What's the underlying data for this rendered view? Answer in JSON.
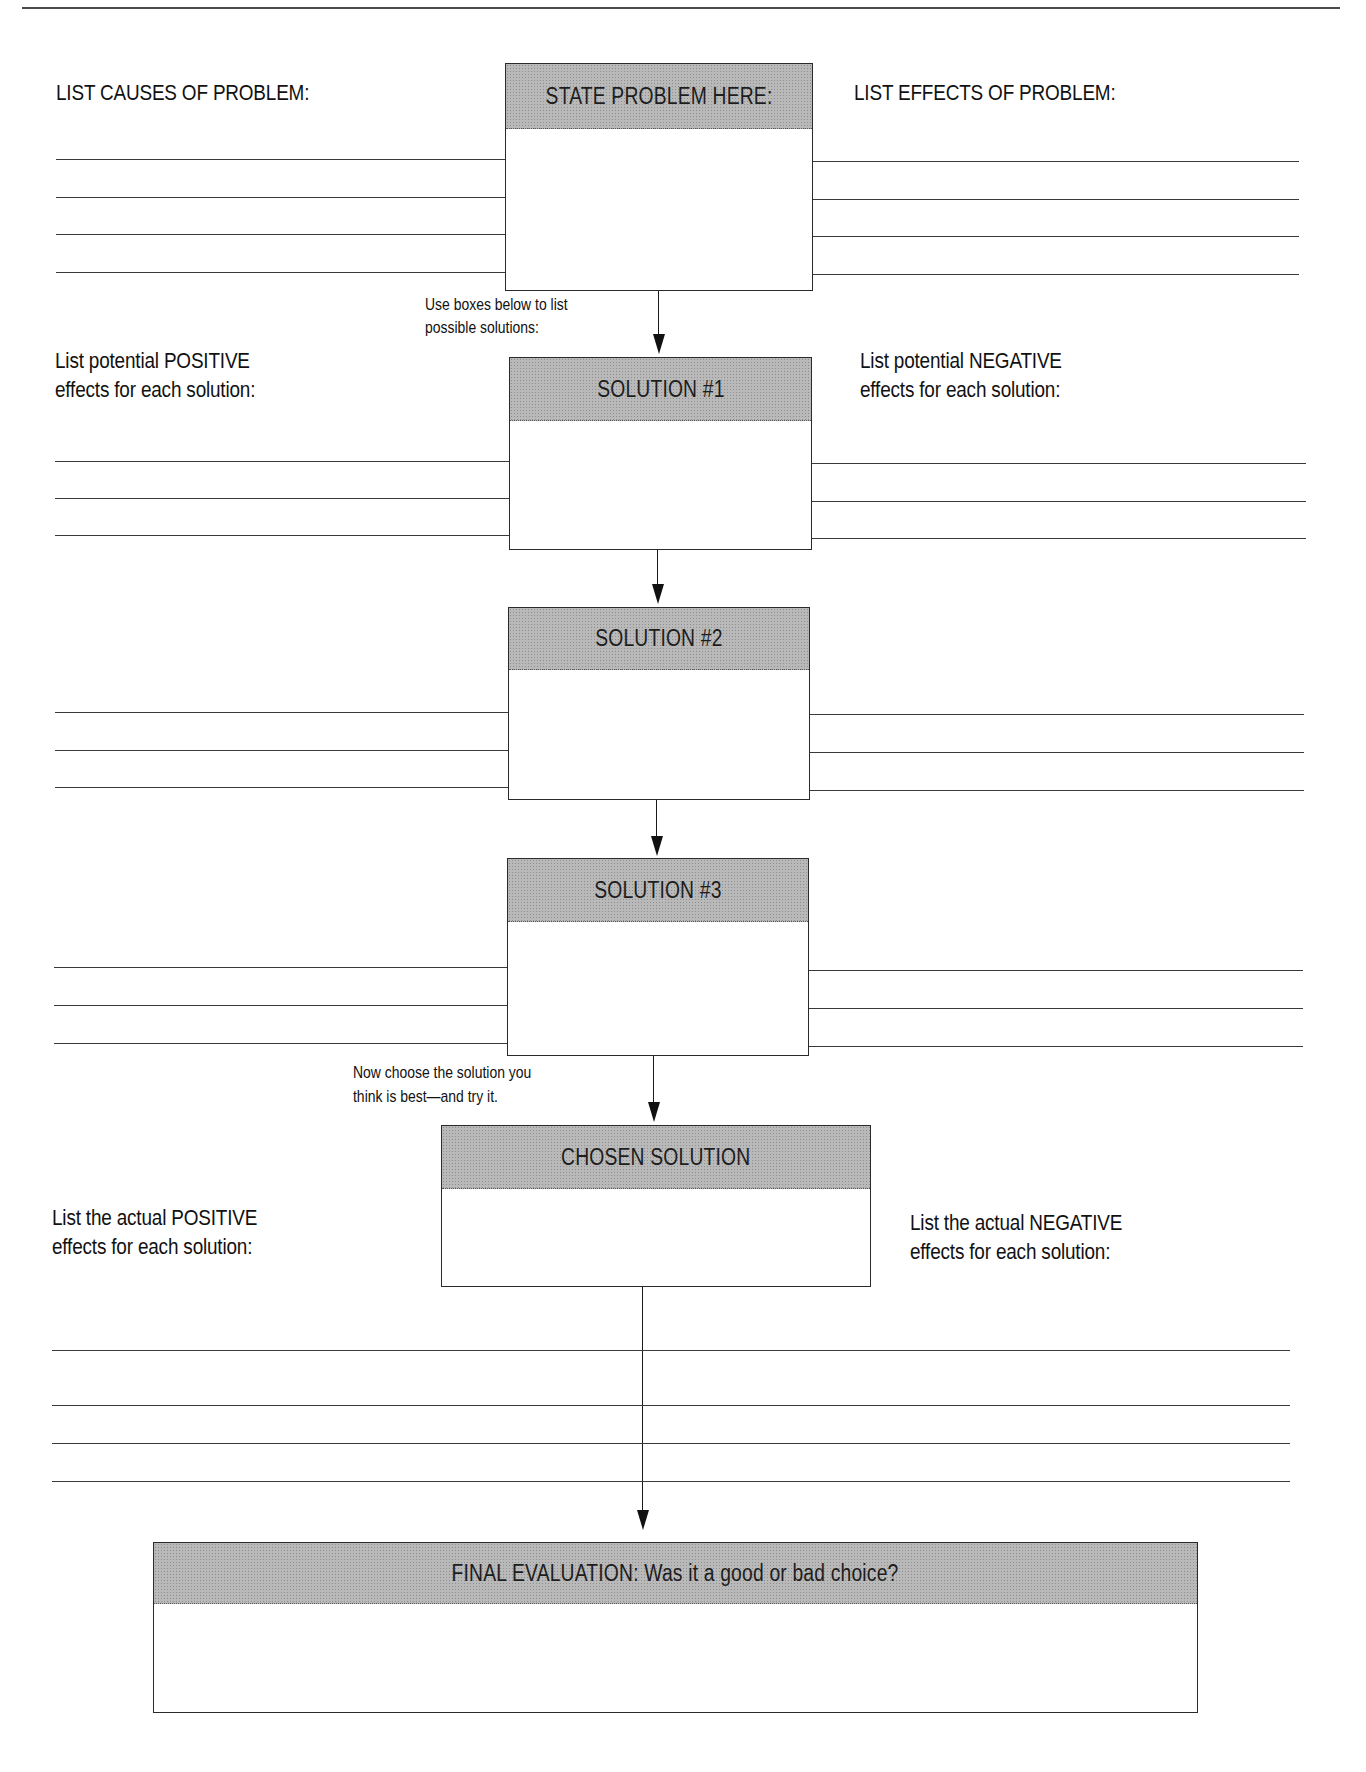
{
  "worksheet": {
    "top_rule_fragment": "g",
    "problem": {
      "causes_label": "LIST CAUSES OF PROBLEM:",
      "box_header": "STATE PROBLEM HERE:",
      "effects_label": "LIST EFFECTS OF PROBLEM:",
      "cause_lines": 4,
      "effect_lines": 4
    },
    "solutions_instruction": "Use boxes below to list possible solutions:",
    "solutions_instruction_lines": [
      "Use boxes below to list",
      "possible solutions:"
    ],
    "potential_positive_label": [
      "List potential POSITIVE",
      "effects for each solution:"
    ],
    "potential_negative_label": [
      "List potential NEGATIVE",
      "effects for each solution:"
    ],
    "solutions": [
      {
        "header": "SOLUTION #1",
        "positive_lines": 3,
        "negative_lines": 3
      },
      {
        "header": "SOLUTION #2",
        "positive_lines": 3,
        "negative_lines": 3
      },
      {
        "header": "SOLUTION #3",
        "positive_lines": 3,
        "negative_lines": 3
      }
    ],
    "choose_instruction_lines": [
      "Now choose the solution you",
      "think is best—and try it."
    ],
    "chosen": {
      "header": "CHOSEN SOLUTION",
      "actual_positive_label": [
        "List the actual POSITIVE",
        "effects for each solution:"
      ],
      "actual_negative_label": [
        "List the actual NEGATIVE",
        "effects for each solution:"
      ],
      "result_lines": 4
    },
    "final": {
      "header": "FINAL EVALUATION: Was it a good or bad choice?"
    },
    "colors": {
      "ink": "#151515",
      "header_fill": "#b9b9b9",
      "paper": "#ffffff"
    }
  }
}
